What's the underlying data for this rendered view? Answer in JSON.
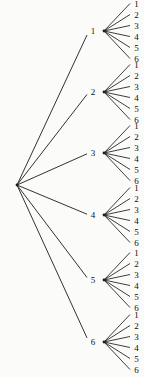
{
  "corner_text": "a.",
  "diagram": {
    "type": "tree",
    "edge_color": "#1b1b1b",
    "text_color": "#111111",
    "background_color": "#fbfbf9",
    "root_label": "",
    "branches": [
      {
        "label": "1",
        "leaves": [
          "1",
          "2",
          "3",
          "4",
          "5",
          "6"
        ]
      },
      {
        "label": "2",
        "leaves": [
          "1",
          "2",
          "3",
          "4",
          "5",
          "6"
        ]
      },
      {
        "label": "3",
        "leaves": [
          "1",
          "2",
          "3",
          "4",
          "5",
          "6"
        ]
      },
      {
        "label": "4",
        "leaves": [
          "1",
          "2",
          "3",
          "4",
          "5",
          "6"
        ]
      },
      {
        "label": "5",
        "leaves": [
          "1",
          "2",
          "3",
          "4",
          "5",
          "6"
        ]
      },
      {
        "label": "6",
        "leaves": [
          "1",
          "2",
          "3",
          "4",
          "5",
          "6"
        ]
      }
    ]
  }
}
